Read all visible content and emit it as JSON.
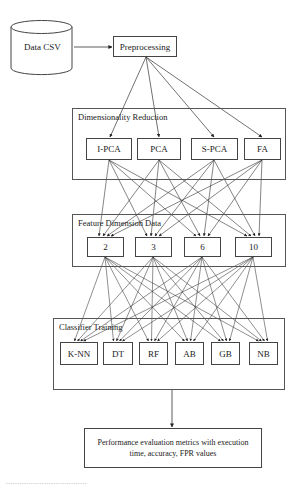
{
  "diagram": {
    "source": {
      "label": "Data CSV",
      "shape": "cylinder"
    },
    "preprocessing": {
      "label": "Preprocessing"
    },
    "dimensionality_reduction": {
      "title": "Dimensionality Reduction",
      "methods": [
        "I-PCA",
        "PCA",
        "S-PCA",
        "FA"
      ]
    },
    "feature_dimension": {
      "title": "Feature Dimension Data",
      "values": [
        "2",
        "3",
        "6",
        "10"
      ]
    },
    "classifier_training": {
      "title": "Classifier Training",
      "classifiers": [
        "K-NN",
        "DT",
        "RF",
        "AB",
        "GB",
        "NB"
      ]
    },
    "evaluation": {
      "label": "Performance evaluation metrics with execution time, accuracy, FPR values"
    },
    "edges": [
      "Data CSV -> Preprocessing",
      "Preprocessing -> each Dimensionality Reduction method",
      "each Dimensionality Reduction method -> each Feature Dimension value",
      "each Feature Dimension value -> each Classifier",
      "Classifier Training -> Performance evaluation"
    ],
    "caption": "...................................."
  }
}
